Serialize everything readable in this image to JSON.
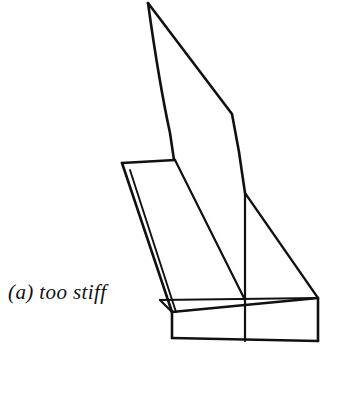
{
  "figure": {
    "caption": "(a) too stiff",
    "style": "black line drawing on white background",
    "colors": {
      "background": "#ffffff",
      "line": "#111111"
    },
    "canvas": {
      "width": 361,
      "height": 398
    },
    "line_weights": {
      "outline": 2.6,
      "inner": 2.2,
      "thin": 1.9
    },
    "paths": {
      "fin_left_edge": "M148,3 C152,32 162,96 170,133 L174,160",
      "fin_right_edge": "M148,3 L232,114 L239,152 L245,193",
      "shelf_top_edge": "M122,163 L175,160",
      "fin_base_diagonal": "M175,160 L245,300",
      "slab_left_side_outer": "M122,163 L172,312",
      "slab_left_side_inner": "M130,170 L176,312",
      "slab_top_left_edge": "M160,300 L172,338",
      "slab_top_rear_edge": "M160,300 L318,298",
      "slab_front_top_edge": "M172,312 L318,298",
      "slab_front_bottom_edge": "M172,338 L318,341",
      "slab_front_left_edge": "M172,312 L172,338",
      "slab_right_end_edge": "M318,298 L318,341",
      "slab_rear_right_diagonal": "M245,193 L318,298",
      "fin_right_vertical": "M245,193 L245,300",
      "fin_front_vertical": "M245,300 L245,341",
      "slab_left_bottom_corner": "M160,300 L172,312"
    }
  }
}
